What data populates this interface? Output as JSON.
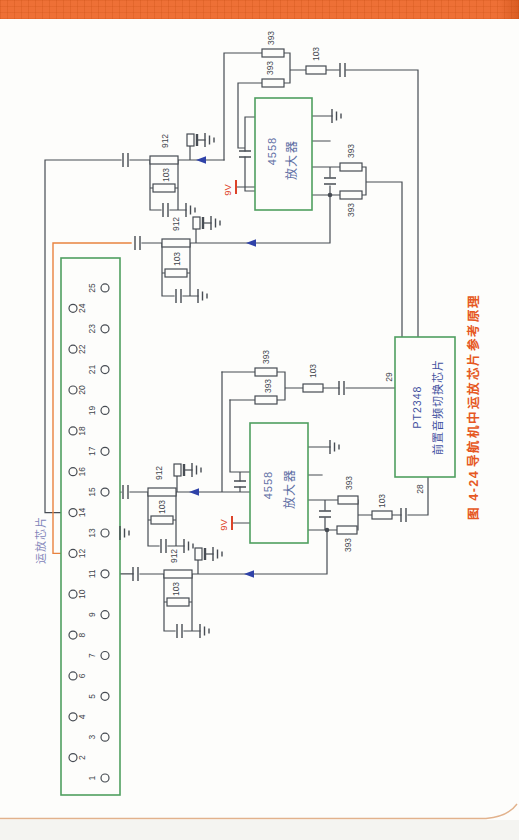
{
  "caption": {
    "figure": "图 4-24",
    "title": "导航机中运放芯片参考原理"
  },
  "connector": {
    "label": "运放芯片",
    "pins": [
      "1",
      "2",
      "3",
      "4",
      "5",
      "6",
      "7",
      "8",
      "9",
      "10",
      "11",
      "12",
      "13",
      "14",
      "15",
      "16",
      "17",
      "18",
      "19",
      "20",
      "21",
      "22",
      "23",
      "24",
      "25"
    ]
  },
  "parts": {
    "r912": "912",
    "r103": "103",
    "r393": "393",
    "supply": "9V",
    "opamp_part": "4558",
    "opamp_name": "放大器",
    "switch_part": "PT2348",
    "switch_name": "前置音频切换芯片",
    "pin29": "29",
    "pin28": "28"
  }
}
